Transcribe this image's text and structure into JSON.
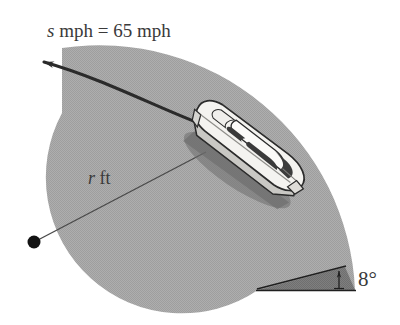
{
  "figure": {
    "labels": {
      "speed": {
        "italic_var": "s",
        "text": " mph = 65 mph",
        "full": "s mph = 65 mph",
        "value": 65,
        "unit": "mph"
      },
      "radius": {
        "italic_var": "r",
        "text": " ft",
        "full": "r ft",
        "unit": "ft"
      },
      "bank_angle": {
        "full": "8°",
        "value": 8,
        "unit": "degrees"
      }
    },
    "colors": {
      "road_surface": "#a9a9a9",
      "road_bank_wedge": "#7d7d7d",
      "background": "#ffffff",
      "car_body": "#f2f1ee",
      "car_glass": "#3f3f3f",
      "ink": "#2b2b2b",
      "text": "#3a3a3a",
      "thin_line": "#4a4a4a"
    },
    "elements": {
      "center_dot": "center-of-curvature-dot",
      "radius_line": "radius-leader-line",
      "velocity_arrow": "velocity-direction-arrow",
      "bank_arrow": "bank-angle-indicator-arrow",
      "car": "car-illustration",
      "road": "curved-road-band"
    }
  }
}
